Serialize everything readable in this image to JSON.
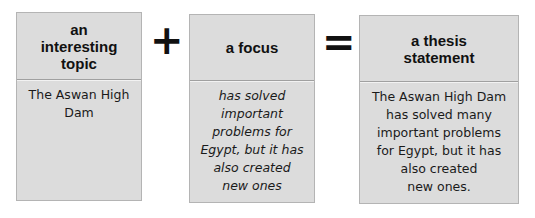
{
  "diagram": {
    "boxes": [
      {
        "header": "an\ninteresting\ntopic",
        "header_lines": [
          "an",
          "interesting",
          "topic"
        ],
        "body_lines": [
          "The Aswan High",
          "Dam"
        ]
      },
      {
        "header": "a focus",
        "header_lines": [
          "a focus"
        ],
        "body_lines": [
          "has solved",
          "important",
          "problems for",
          "Egypt, but it has",
          "also created",
          "new ones"
        ]
      },
      {
        "header": "a thesis statement",
        "header_lines": [
          "a thesis",
          "statement"
        ],
        "body_lines": [
          "The Aswan High Dam",
          "has solved many",
          "important problems",
          "for Egypt, but it has",
          "also created",
          "new ones."
        ]
      }
    ],
    "operators": [
      "+",
      "="
    ],
    "colors": {
      "box_fill": "#dcdcdc",
      "box_border": "#b4b4b4",
      "text": "#111111"
    }
  }
}
